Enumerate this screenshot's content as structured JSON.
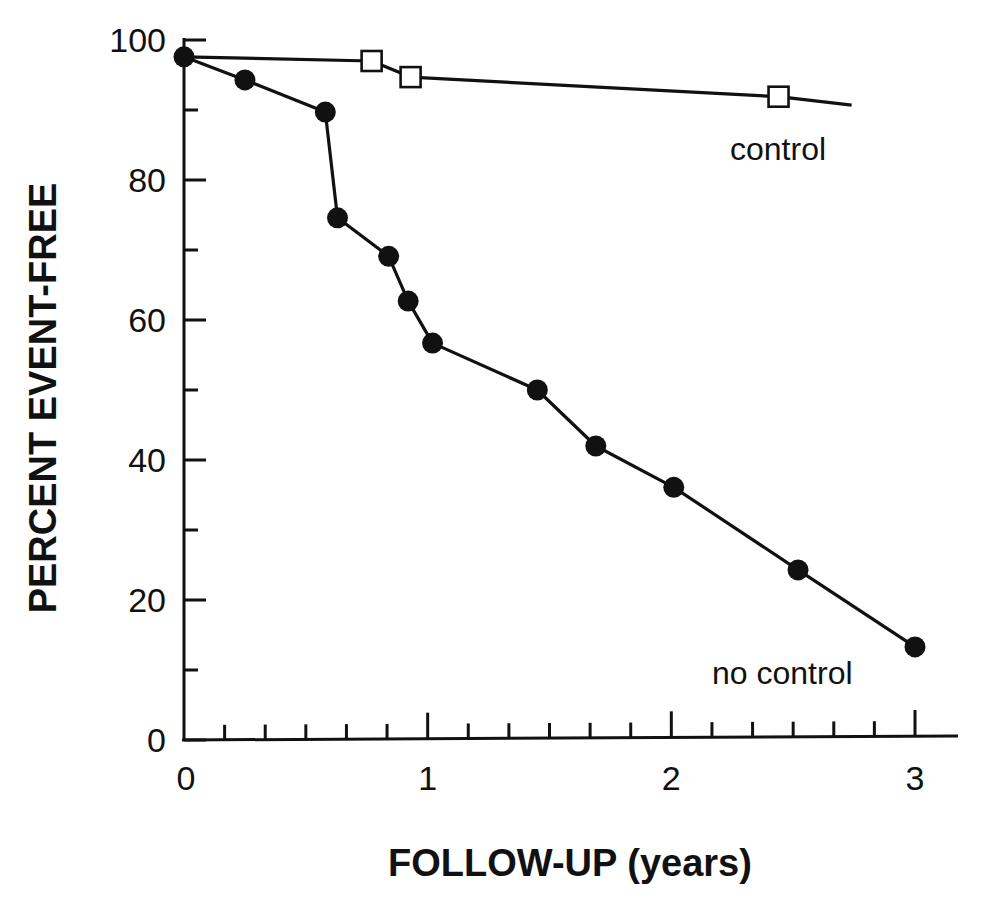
{
  "chart_data": {
    "type": "line",
    "title": "",
    "xlabel": "FOLLOW-UP (years)",
    "ylabel": "PERCENT EVENT-FREE",
    "xlim": [
      0,
      3
    ],
    "ylim": [
      0,
      100
    ],
    "x_ticks": [
      0,
      1,
      2,
      3
    ],
    "x_minor_step": 0.1667,
    "y_ticks": [
      0,
      20,
      40,
      60,
      80,
      100
    ],
    "y_minor_step": 10,
    "grid": false,
    "legend": "inline labels",
    "series": [
      {
        "name": "control",
        "marker": "open-square",
        "x": [
          0,
          0.77,
          0.93,
          2.44,
          2.74
        ],
        "y": [
          97.6,
          97.0,
          94.7,
          91.9,
          90.7
        ],
        "marker_points": [
          1,
          2,
          3
        ],
        "label_text": "control"
      },
      {
        "name": "no control",
        "marker": "filled-circle",
        "x": [
          0,
          0.25,
          0.58,
          0.63,
          0.84,
          0.92,
          1.02,
          1.45,
          1.69,
          2.01,
          2.52,
          3.0
        ],
        "y": [
          97.6,
          94.3,
          89.7,
          74.6,
          69.1,
          62.7,
          56.7,
          50.0,
          42.0,
          36.1,
          24.3,
          13.3
        ],
        "label_text": "no control"
      }
    ]
  }
}
